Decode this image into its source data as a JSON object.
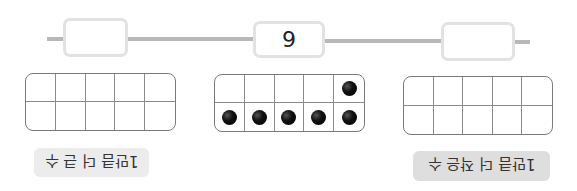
{
  "number_line": {
    "boxes": [
      {
        "position": "left",
        "value": ""
      },
      {
        "position": "middle",
        "value": "9"
      },
      {
        "position": "right",
        "value": ""
      }
    ]
  },
  "ten_frames": [
    {
      "position": "left",
      "dots": [
        0,
        0,
        0,
        0,
        0,
        0,
        0,
        0,
        0,
        0
      ]
    },
    {
      "position": "middle",
      "dots": [
        0,
        0,
        0,
        0,
        1,
        1,
        1,
        1,
        1,
        1
      ],
      "count": 6
    },
    {
      "position": "right",
      "dots": [
        0,
        0,
        0,
        0,
        0,
        0,
        0,
        0,
        0,
        0
      ]
    }
  ],
  "labels": {
    "left": "1만큼 더 큰 수",
    "right": "1만큼 더 작은 수"
  },
  "colors": {
    "line": "#b8b8b8",
    "box_border": "#e2e2e2",
    "label_bg_left": "#ececec",
    "label_bg_right": "#dedede"
  }
}
